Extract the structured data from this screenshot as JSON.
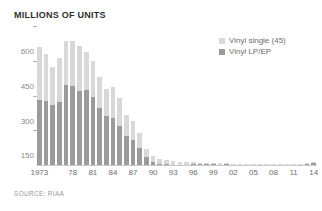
{
  "chart_data": {
    "type": "bar",
    "subtype": "stacked-bar",
    "title": "MILLIONS OF UNITS",
    "xlabel": "",
    "ylabel": "Millions of units",
    "ylim": [
      0,
      600
    ],
    "yticks": [
      150,
      300,
      450,
      600
    ],
    "ytick_labels": [
      "150",
      "300",
      "450",
      "600"
    ],
    "grid": false,
    "legend_position": "top-right",
    "source": "SOURCE: RIAA",
    "colors": {
      "vinyl_single": "#d8d8d8",
      "vinyl_lp_ep": "#9b9b9b",
      "axis": "#c9c9c9",
      "text": "#6e6e6e",
      "title": "#2f2f2f"
    },
    "categories": [
      "1973",
      "1974",
      "1975",
      "1976",
      "1977",
      "1978",
      "1979",
      "1980",
      "1981",
      "1982",
      "1983",
      "1984",
      "1985",
      "1986",
      "1987",
      "1988",
      "1989",
      "1990",
      "1991",
      "1992",
      "1993",
      "1994",
      "1995",
      "1996",
      "1997",
      "1998",
      "1999",
      "2000",
      "2001",
      "2002",
      "2003",
      "2004",
      "2005",
      "2006",
      "2007",
      "2008",
      "2009",
      "2010",
      "2011",
      "2012",
      "2013",
      "2014"
    ],
    "xtick_labels": [
      "1973",
      "78",
      "81",
      "84",
      "87",
      "90",
      "93",
      "96",
      "99",
      "02",
      "05",
      "08",
      "11",
      "14"
    ],
    "xtick_categories": [
      "1973",
      "1978",
      "1981",
      "1984",
      "1987",
      "1990",
      "1993",
      "1996",
      "1999",
      "2002",
      "2005",
      "2008",
      "2011",
      "2014"
    ],
    "series": [
      {
        "name": "Vinyl LP/EP",
        "color": "#9b9b9b",
        "values": [
          280,
          276,
          257,
          273,
          344,
          341,
          318,
          322,
          295,
          244,
          210,
          205,
          167,
          125,
          107,
          72,
          35,
          12,
          4.8,
          2.3,
          1.2,
          1.9,
          2.2,
          2.9,
          2.7,
          3.4,
          2.9,
          2.2,
          2.3,
          1.7,
          1.5,
          1.4,
          1.0,
          1.3,
          1.3,
          1.9,
          2.5,
          2.8,
          3.9,
          4.6,
          6.1,
          9.2
        ]
      },
      {
        "name": "Vinyl single (45)",
        "color": "#d8d8d8",
        "values": [
          228,
          204,
          164,
          190,
          190,
          194,
          195,
          164,
          154,
          137,
          120,
          132,
          121,
          93,
          82,
          65,
          36,
          27,
          22,
          19,
          15,
          11,
          10,
          10,
          7,
          5.4,
          5.3,
          4.4,
          5.5,
          4.4,
          4.0,
          2.9,
          2.4,
          2.2,
          1.4,
          1.2,
          1.0,
          1.0,
          1.1,
          1.2,
          1.3,
          1.7
        ]
      }
    ]
  },
  "legend": [
    {
      "label": "Vinyl single (45)",
      "swatch": "#d8d8d8"
    },
    {
      "label": "Vinyl LP/EP",
      "swatch": "#9b9b9b"
    }
  ]
}
